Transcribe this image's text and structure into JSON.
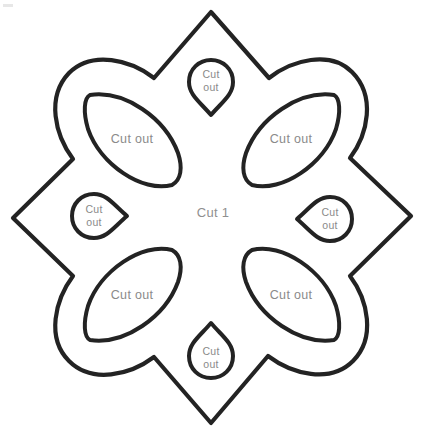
{
  "document": {
    "title": "Flower Papercraft Cutting Template",
    "background_color": "#ffffff",
    "stroke_color": "#232323",
    "label_color": "#8a8a8a",
    "width": 431,
    "height": 441
  },
  "center": {
    "label": "Cut 1"
  },
  "petals": [
    {
      "position": "top-left",
      "label": "Cut out"
    },
    {
      "position": "top-right",
      "label": "Cut out"
    },
    {
      "position": "bottom-left",
      "label": "Cut out"
    },
    {
      "position": "bottom-right",
      "label": "Cut out"
    }
  ],
  "teardrops": [
    {
      "position": "top",
      "line1": "Cut",
      "line2": "out"
    },
    {
      "position": "right",
      "line1": "Cut",
      "line2": "out"
    },
    {
      "position": "bottom",
      "line1": "Cut",
      "line2": "out"
    },
    {
      "position": "left",
      "line1": "Cut",
      "line2": "out"
    }
  ]
}
